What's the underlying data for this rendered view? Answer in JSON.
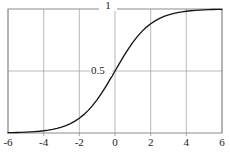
{
  "chart_data": {
    "type": "line",
    "title": "",
    "subtitle": "",
    "xlabel": "",
    "ylabel": "",
    "xlim": [
      -6,
      6
    ],
    "ylim": [
      0,
      1
    ],
    "grid": true,
    "legend": null,
    "x_ticks": [
      -6,
      -4,
      -2,
      0,
      2,
      4,
      6
    ],
    "x_tick_labels": [
      "-6",
      "-4",
      "-2",
      "0",
      "2",
      "4",
      "6"
    ],
    "y_ticks": [
      0.5,
      1
    ],
    "y_tick_labels": [
      "0.5",
      "1"
    ],
    "annotations": [],
    "series": [
      {
        "name": "sigmoid",
        "color": "#161616",
        "x": [
          -6,
          -5.75,
          -5.5,
          -5.25,
          -5,
          -4.75,
          -4.5,
          -4.25,
          -4,
          -3.75,
          -3.5,
          -3.25,
          -3,
          -2.75,
          -2.5,
          -2.25,
          -2,
          -1.75,
          -1.5,
          -1.25,
          -1,
          -0.75,
          -0.5,
          -0.25,
          0,
          0.25,
          0.5,
          0.75,
          1,
          1.25,
          1.5,
          1.75,
          2,
          2.25,
          2.5,
          2.75,
          3,
          3.25,
          3.5,
          3.75,
          4,
          4.25,
          4.5,
          4.75,
          5,
          5.25,
          5.5,
          5.75,
          6
        ],
        "y": [
          0.002473,
          0.003173,
          0.00407,
          0.00522,
          0.006693,
          0.008577,
          0.010987,
          0.014064,
          0.017986,
          0.022977,
          0.029312,
          0.037327,
          0.047426,
          0.060087,
          0.075858,
          0.095349,
          0.119203,
          0.148047,
          0.182426,
          0.2227,
          0.268941,
          0.320821,
          0.377541,
          0.437823,
          0.5,
          0.562177,
          0.622459,
          0.679179,
          0.731059,
          0.7773,
          0.817574,
          0.851953,
          0.880797,
          0.904651,
          0.924142,
          0.939913,
          0.952574,
          0.962673,
          0.970688,
          0.977023,
          0.982014,
          0.985936,
          0.989013,
          0.991423,
          0.993307,
          0.99478,
          0.99593,
          0.996827,
          0.997527
        ]
      }
    ]
  },
  "plot": {
    "frame": {
      "left": 8,
      "top": 9,
      "right": 222,
      "bottom": 133
    },
    "grid_color": "#9b9b9b",
    "frame_color": "#8c8c8c",
    "curve_color": "#161616",
    "background": "#ffffff"
  }
}
